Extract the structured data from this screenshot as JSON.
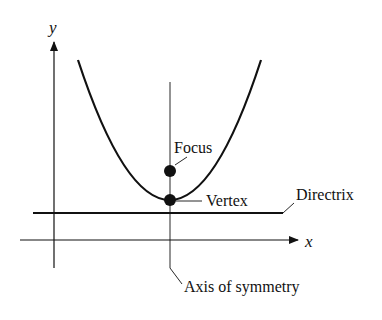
{
  "figure": {
    "type": "parabola-anatomy",
    "axes": {
      "x_label": "x",
      "y_label": "y"
    },
    "labels": {
      "focus": "Focus",
      "vertex": "Vertex",
      "directrix": "Directrix",
      "axis_of_symmetry": "Axis of symmetry"
    },
    "colors": {
      "stroke": "#111111",
      "background": "#ffffff"
    }
  }
}
